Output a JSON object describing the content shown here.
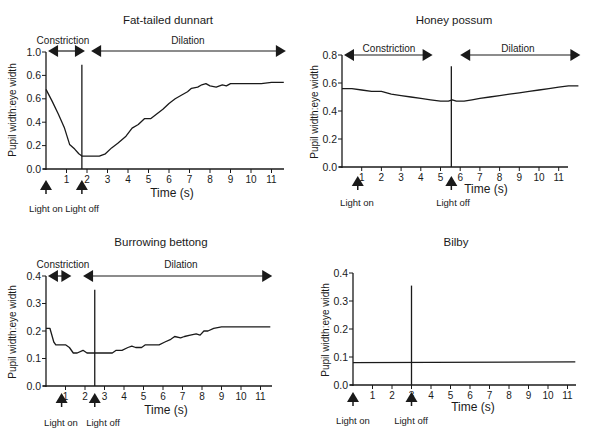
{
  "chart_data": [
    {
      "type": "line",
      "title": "Fat-tailed dunnart",
      "xlabel": "Time (s)",
      "ylabel": "Pupil width:eye width",
      "x_ticks": [
        "1",
        "2",
        "3",
        "4",
        "5",
        "6",
        "7",
        "8",
        "9",
        "10",
        "11"
      ],
      "y_ticks": [
        "0.0",
        "0.2",
        "0.4",
        "0.6",
        "0.6",
        "1.0"
      ],
      "y_tick_values": [
        0.0,
        0.2,
        0.4,
        0.6,
        0.8,
        1.0
      ],
      "ylim": [
        0,
        1.0
      ],
      "xlim": [
        0,
        11.6
      ],
      "grid": false,
      "phases": [
        {
          "label": "Constriction",
          "x_start": 0.1,
          "x_end": 1.9
        },
        {
          "label": "Dilation",
          "x_start": 2.2,
          "x_end": 11.7
        }
      ],
      "markers": [
        {
          "label": "Light on",
          "x": 0.0
        },
        {
          "label": "Light off",
          "x": 1.75
        }
      ],
      "stimulus_line_x": 1.75,
      "stimulus_line_top": 0.89,
      "series": [
        {
          "name": "pupil ratio",
          "x": [
            0.0,
            0.3,
            0.6,
            0.9,
            1.15,
            1.4,
            1.6,
            1.75,
            2.0,
            2.3,
            2.6,
            2.9,
            3.2,
            3.5,
            3.9,
            4.2,
            4.5,
            4.8,
            5.1,
            5.4,
            5.7,
            6.0,
            6.3,
            6.6,
            6.9,
            7.1,
            7.4,
            7.6,
            7.8,
            8.0,
            8.3,
            8.6,
            8.8,
            9.0,
            9.2,
            9.6,
            10.0,
            10.5,
            11.0,
            11.6
          ],
          "y": [
            0.68,
            0.58,
            0.47,
            0.35,
            0.21,
            0.17,
            0.13,
            0.11,
            0.11,
            0.11,
            0.11,
            0.13,
            0.18,
            0.22,
            0.28,
            0.35,
            0.38,
            0.43,
            0.43,
            0.47,
            0.51,
            0.56,
            0.6,
            0.63,
            0.66,
            0.69,
            0.7,
            0.72,
            0.73,
            0.71,
            0.7,
            0.72,
            0.71,
            0.73,
            0.73,
            0.73,
            0.73,
            0.73,
            0.74,
            0.74
          ]
        }
      ]
    },
    {
      "type": "line",
      "title": "Honey possum",
      "xlabel": "Time (s)",
      "ylabel": "Pupil width:eye width",
      "x_ticks": [
        "1",
        "2",
        "3",
        "4",
        "5",
        "6",
        "7",
        "8",
        "9",
        "10",
        "11"
      ],
      "y_ticks": [
        "0.0",
        "0.2",
        "0.4",
        "0.6",
        "0.8"
      ],
      "y_tick_values": [
        0.0,
        0.2,
        0.4,
        0.6,
        0.8
      ],
      "ylim": [
        0,
        0.8
      ],
      "xlim": [
        0,
        12.0
      ],
      "grid": false,
      "phases": [
        {
          "label": "Constriction",
          "x_start": 0.1,
          "x_end": 4.6
        },
        {
          "label": "Dilation",
          "x_start": 6.0,
          "x_end": 12.1
        }
      ],
      "markers": [
        {
          "label": "Light on",
          "x": 0.8
        },
        {
          "label": "Light off",
          "x": 5.55
        }
      ],
      "stimulus_line_x": 5.55,
      "stimulus_line_top": 0.72,
      "series": [
        {
          "name": "pupil ratio",
          "x": [
            0.0,
            0.5,
            1.0,
            1.5,
            2.0,
            2.5,
            3.0,
            3.5,
            4.0,
            4.5,
            5.0,
            5.4,
            5.6,
            5.8,
            6.2,
            6.6,
            7.0,
            7.5,
            8.0,
            8.5,
            9.0,
            9.5,
            10.0,
            10.5,
            11.0,
            11.5,
            12.0
          ],
          "y": [
            0.56,
            0.56,
            0.55,
            0.54,
            0.54,
            0.52,
            0.51,
            0.5,
            0.49,
            0.48,
            0.47,
            0.47,
            0.48,
            0.47,
            0.47,
            0.48,
            0.49,
            0.5,
            0.51,
            0.52,
            0.53,
            0.54,
            0.55,
            0.56,
            0.57,
            0.58,
            0.58
          ]
        }
      ]
    },
    {
      "type": "line",
      "title": "Burrowing bettong",
      "xlabel": "Time (s)",
      "ylabel": "Pupil width:eye width",
      "x_ticks": [
        "1",
        "2",
        "3",
        "4",
        "5",
        "6",
        "7",
        "8",
        "9",
        "10",
        "11"
      ],
      "y_ticks": [
        "0.0",
        "0.1",
        "0.2",
        "0.3",
        "0.4"
      ],
      "y_tick_values": [
        0.0,
        0.1,
        0.2,
        0.3,
        0.4
      ],
      "ylim": [
        0,
        0.4
      ],
      "xlim": [
        0,
        11.6
      ],
      "grid": false,
      "phases": [
        {
          "label": "Constriction",
          "x_start": 0.1,
          "x_end": 1.3
        },
        {
          "label": "Dilation",
          "x_start": 1.9,
          "x_end": 11.6
        }
      ],
      "markers": [
        {
          "label": "Light on",
          "x": 0.8
        },
        {
          "label": "Light off",
          "x": 2.5
        }
      ],
      "stimulus_line_x": 2.5,
      "stimulus_line_top": 0.35,
      "series": [
        {
          "name": "pupil ratio",
          "x": [
            0.0,
            0.2,
            0.4,
            0.5,
            0.6,
            1.0,
            1.2,
            1.4,
            1.6,
            1.9,
            2.1,
            2.5,
            3.0,
            3.4,
            3.6,
            3.9,
            4.2,
            4.4,
            4.6,
            4.9,
            5.1,
            5.5,
            5.8,
            6.1,
            6.4,
            6.6,
            6.9,
            7.1,
            7.4,
            7.7,
            7.9,
            8.1,
            8.3,
            8.6,
            9.0,
            10.0,
            11.0,
            11.5
          ],
          "y": [
            0.21,
            0.21,
            0.16,
            0.15,
            0.15,
            0.15,
            0.14,
            0.12,
            0.12,
            0.13,
            0.12,
            0.12,
            0.12,
            0.12,
            0.13,
            0.13,
            0.14,
            0.145,
            0.14,
            0.14,
            0.15,
            0.15,
            0.15,
            0.16,
            0.17,
            0.18,
            0.175,
            0.18,
            0.185,
            0.19,
            0.185,
            0.2,
            0.2,
            0.21,
            0.215,
            0.215,
            0.215,
            0.215
          ]
        }
      ]
    },
    {
      "type": "line",
      "title": "Bilby",
      "xlabel": "Time (s)",
      "ylabel": "Pupil width:eye width",
      "x_ticks": [
        "1",
        "2",
        "3",
        "4",
        "5",
        "6",
        "7",
        "8",
        "9",
        "10",
        "11"
      ],
      "y_ticks": [
        "0.0",
        "0.1",
        "0.2",
        "0.3",
        "0.4"
      ],
      "y_tick_values": [
        0.0,
        0.1,
        0.2,
        0.3,
        0.4
      ],
      "ylim": [
        0,
        0.4
      ],
      "xlim": [
        0,
        11.4
      ],
      "grid": false,
      "phases": [],
      "markers": [
        {
          "label": "Light on",
          "x": 0.0
        },
        {
          "label": "Light off",
          "x": 3.0
        }
      ],
      "stimulus_line_x": 3.0,
      "stimulus_line_top": 0.355,
      "series": [
        {
          "name": "pupil ratio",
          "x": [
            0.0,
            11.4
          ],
          "y": [
            0.08,
            0.083
          ]
        }
      ]
    }
  ],
  "panels": [
    {
      "title": "Fat-tailed dunnart",
      "xlabel": "Time (s)",
      "ylabel": "Pupil width:eye width",
      "light_on": "Light on",
      "light_off": "Light off",
      "constriction": "Constriction",
      "dilation": "Dilation"
    },
    {
      "title": "Honey possum",
      "xlabel": "Time (s)",
      "ylabel": "Pupil width:eye width",
      "light_on": "Light on",
      "light_off": "Light off",
      "constriction": "Constriction",
      "dilation": "Dilation"
    },
    {
      "title": "Burrowing bettong",
      "xlabel": "Time (s)",
      "ylabel": "Pupil width:eye width",
      "light_on": "Light on",
      "light_off": "Light off",
      "constriction": "Constriction",
      "dilation": "Dilation"
    },
    {
      "title": "Bilby",
      "xlabel": "Time (s)",
      "ylabel": "Pupil width:eye width",
      "light_on": "Light on",
      "light_off": "Light off"
    }
  ],
  "colors": {
    "ink": "#1a1a1a",
    "background": "#ffffff"
  }
}
